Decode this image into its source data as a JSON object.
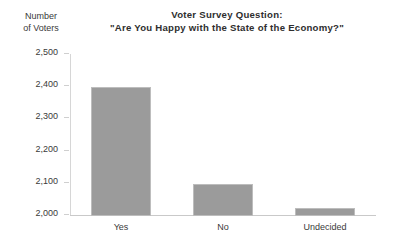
{
  "chart_data": {
    "type": "bar",
    "title": "Voter Survey Question: \"Are You Happy with the State of the Economy?\"",
    "title_lines": [
      "Voter Survey Question:",
      "\"Are You Happy with the State of the Economy?\""
    ],
    "ylabel": "Number of Voters",
    "ylabel_lines": [
      "Number",
      "of Voters"
    ],
    "xlabel": "",
    "categories": [
      "Yes",
      "No",
      "Undecided"
    ],
    "values": [
      2400,
      2100,
      2025
    ],
    "ylim": [
      2000,
      2500
    ],
    "ytick_values": [
      2000,
      2100,
      2200,
      2300,
      2400,
      2500
    ],
    "ytick_labels": [
      "2,000",
      "2,100",
      "2,200",
      "2,300",
      "2,400",
      "2,500"
    ],
    "grid": false,
    "legend": false,
    "bar_color": "#9b9b9b",
    "bar_border_color": "#bdbdbd",
    "axis_color": "#c9c9c9",
    "text_color": "#3a3a3a"
  }
}
